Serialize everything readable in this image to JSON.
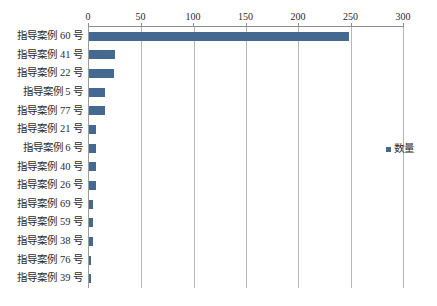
{
  "chart_data": {
    "type": "bar",
    "orientation": "horizontal",
    "title": "",
    "xlabel": "",
    "ylabel": "",
    "categories": [
      "指导案例 60 号",
      "指导案例 41 号",
      "指导案例 22 号",
      "指导案例 5 号",
      "指导案例 77 号",
      "指导案例 21 号",
      "指导案例 6 号",
      "指导案例 40 号",
      "指导案例 26 号",
      "指导案例 69 号",
      "指导案例 59 号",
      "指导案例 38 号",
      "指导案例 76 号",
      "指导案例 39 号"
    ],
    "values": [
      248,
      25,
      24,
      15,
      15,
      7,
      7,
      7,
      7,
      4,
      4,
      4,
      2,
      2
    ],
    "series": [
      {
        "name": "数量",
        "values": [
          248,
          25,
          24,
          15,
          15,
          7,
          7,
          7,
          7,
          4,
          4,
          4,
          2,
          2
        ],
        "color": "#44688f"
      }
    ],
    "value_axis": {
      "position": "top",
      "min": 0,
      "max": 300,
      "tick_step": 50,
      "ticks": [
        0,
        50,
        100,
        150,
        200,
        250,
        300
      ],
      "tick_labels": [
        "0",
        "50",
        "100",
        "150",
        "200",
        "250",
        "300"
      ]
    },
    "grid": {
      "vertical": true,
      "horizontal": false,
      "color": "#b6b6b6"
    },
    "legend": {
      "position": "right",
      "entries": [
        {
          "label": "数量",
          "color": "#44688f"
        }
      ]
    }
  }
}
